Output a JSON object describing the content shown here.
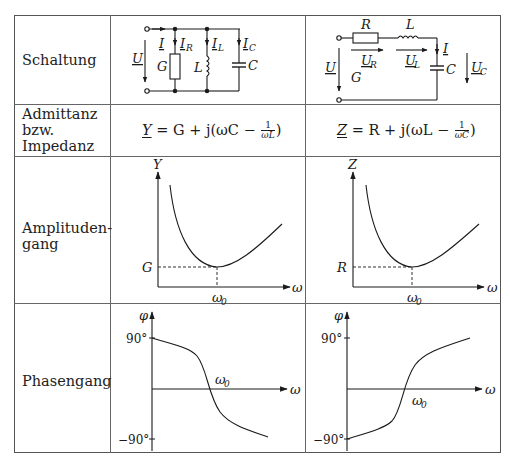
{
  "rows": [
    {
      "label": "Schaltung"
    },
    {
      "label_lines": [
        "Admittanz",
        "bzw.",
        "Impedanz"
      ]
    },
    {
      "label_lines": [
        "Amplituden-",
        "gang"
      ]
    },
    {
      "label": "Phasengang"
    }
  ],
  "parallel": {
    "circuit": {
      "labels": {
        "U": "U",
        "I": "I",
        "IR": "I",
        "IR_sub": "R",
        "IL": "I",
        "IL_sub": "L",
        "IC": "I",
        "IC_sub": "C",
        "G": "G",
        "L": "L",
        "C": "C"
      }
    },
    "formula": {
      "lhs": "Y",
      "eq": " = G + j(ωC − ",
      "num": "1",
      "den": "ωL",
      "close": ")"
    },
    "amplitude": {
      "y_axis": "Y",
      "x_axis": "ω",
      "min_label": "G",
      "w0": "ω",
      "w0_sub": "0"
    },
    "phase": {
      "y_axis": "φ",
      "x_axis": "ω",
      "top": "90°",
      "bottom": "−90°",
      "w0": "ω",
      "w0_sub": "0"
    }
  },
  "series": {
    "circuit": {
      "labels": {
        "R": "R",
        "L": "L",
        "I": "I",
        "UR": "U",
        "UR_sub": "R",
        "UL": "U",
        "UL_sub": "L",
        "U": "U",
        "G": "G",
        "C": "C",
        "UC": "U",
        "UC_sub": "C"
      }
    },
    "formula": {
      "lhs": "Z",
      "eq": " = R + j(ωL − ",
      "num": "1",
      "den": "ωC",
      "close": ")"
    },
    "amplitude": {
      "y_axis": "Z",
      "x_axis": "ω",
      "min_label": "R",
      "w0": "ω",
      "w0_sub": "0"
    },
    "phase": {
      "y_axis": "φ",
      "x_axis": "ω",
      "top": "90°",
      "bottom": "−90°",
      "w0": "ω",
      "w0_sub": "0"
    }
  }
}
